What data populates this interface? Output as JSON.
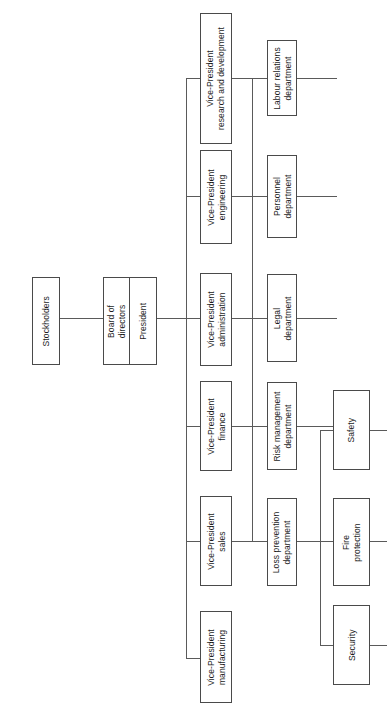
{
  "chart": {
    "type": "organizational-chart",
    "orientation": "rotated-90-counterclockwise",
    "background_color": "#ffffff",
    "box_border_color": "#4a4a4a",
    "connector_color": "#5a5a5a",
    "text_color": "#1c1c1c"
  },
  "nodes": {
    "stockholders": "Stockholders",
    "board_of_directors": "Board of\ndirectors",
    "president": "President",
    "vp_research_development": "Vice-President\nresearch and development",
    "vp_engineering": "Vice-President\nengineering",
    "vp_administration": "Vice-President\nadministration",
    "vp_finance": "Vice-President\nfinance",
    "vp_sales": "Vice-President\nsales",
    "vp_manufacturing": "Vice-President\nmanufacturing",
    "labour_relations_department": "Labour relations\ndepartment",
    "personnel_department": "Personnel\ndepartment",
    "legal_department": "Legal\ndepartment",
    "risk_management_department": "Risk management\ndepartment",
    "loss_prevention_department": "Loss prevention\ndepartment",
    "safety": "Safety",
    "fire_protection": "Fire\nprotection",
    "security": "Security"
  }
}
